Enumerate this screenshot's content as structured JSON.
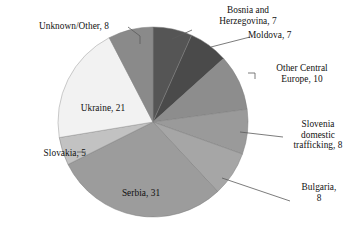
{
  "chart_data": {
    "type": "pie",
    "title": "",
    "total": 105,
    "legend_position": "outside-labels",
    "grid": false,
    "categories": [
      "Bosnia and Herzegovina",
      "Moldova",
      "Other Central Europe",
      "Slovenia domestic trafficking",
      "Bulgaria",
      "Serbia",
      "Slovakia",
      "Ukraine",
      "Unknown/Other"
    ],
    "values": [
      7,
      7,
      10,
      8,
      8,
      31,
      5,
      21,
      8
    ],
    "colors": [
      "#555555",
      "#4a4a4a",
      "#8d8d8d",
      "#9a9a9a",
      "#a6a6a6",
      "#9c9c9c",
      "#c2c2c2",
      "#f2f2f2",
      "#8a8a8a"
    ],
    "labels": [
      {
        "text": "Bosnia and Herzegovina, 7",
        "lines": [
          "Bosnia and",
          "Herzegovina, 7"
        ]
      },
      {
        "text": "Moldova, 7",
        "lines": [
          "Moldova, 7"
        ]
      },
      {
        "text": "Other Central Europe, 10",
        "lines": [
          "Other Central",
          "Europe, 10"
        ]
      },
      {
        "text": "Slovenia domestic trafficking, 8",
        "lines": [
          "Slovenia",
          "domestic",
          "trafficking, 8"
        ]
      },
      {
        "text": "Bulgaria, 8",
        "lines": [
          "Bulgaria,",
          "8"
        ]
      },
      {
        "text": "Serbia, 31",
        "lines": [
          "Serbia, 31"
        ]
      },
      {
        "text": "Slovakia, 5",
        "lines": [
          "Slovakia, 5"
        ]
      },
      {
        "text": "Ukraine, 21",
        "lines": [
          "Ukraine, 21"
        ]
      },
      {
        "text": "Unknown/Other, 8",
        "lines": [
          "Unknown/Other, 8"
        ]
      }
    ]
  },
  "labels": {
    "bosnia_l1": "Bosnia and",
    "bosnia_l2": "Herzegovina, 7",
    "moldova": "Moldova, 7",
    "othercentral_l1": "Other Central",
    "othercentral_l2": "Europe, 10",
    "slovenia_l1": "Slovenia",
    "slovenia_l2": "domestic",
    "slovenia_l3": "trafficking, 8",
    "bulgaria_l1": "Bulgaria,",
    "bulgaria_l2": "8",
    "serbia": "Serbia, 31",
    "slovakia": "Slovakia, 5",
    "ukraine": "Ukraine, 21",
    "unknown": "Unknown/Other, 8"
  },
  "colors": {
    "background": "#ffffff",
    "text": "#111111",
    "leader_line": "#5a5a5a",
    "slice_edge": "#7d7d7d"
  }
}
